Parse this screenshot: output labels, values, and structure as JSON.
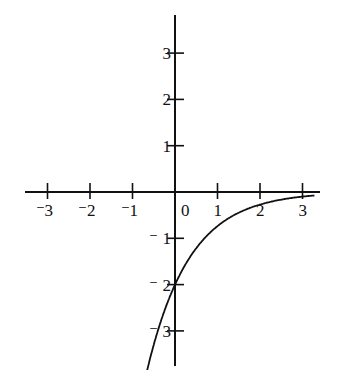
{
  "chart_data": {
    "type": "line",
    "title": "",
    "xlabel": "",
    "ylabel": "",
    "function": "y = -2e^(-x)",
    "xlim": [
      -3.4,
      3.4
    ],
    "ylim": [
      -3.8,
      3.8
    ],
    "grid": false,
    "x_ticks": [
      -3,
      -2,
      -1,
      0,
      1,
      2,
      3
    ],
    "y_ticks": [
      3,
      2,
      1,
      -1,
      -2,
      -3
    ],
    "x_tick_labels": [
      "-3",
      "-2",
      "-1",
      "0",
      "1",
      "2",
      "3"
    ],
    "y_tick_labels": [
      "3",
      "2",
      "1",
      "-1",
      "-2",
      "-3"
    ],
    "series": [
      {
        "name": "curve",
        "x": [
          -0.65,
          -0.5,
          -0.25,
          0,
          0.25,
          0.5,
          0.75,
          1,
          1.5,
          2,
          2.5,
          3,
          3.3
        ],
        "y": [
          -3.83,
          -3.3,
          -2.57,
          -2.0,
          -1.56,
          -1.21,
          -0.94,
          -0.74,
          -0.45,
          -0.27,
          -0.16,
          -0.1,
          -0.07
        ]
      }
    ],
    "color": "#111111"
  }
}
